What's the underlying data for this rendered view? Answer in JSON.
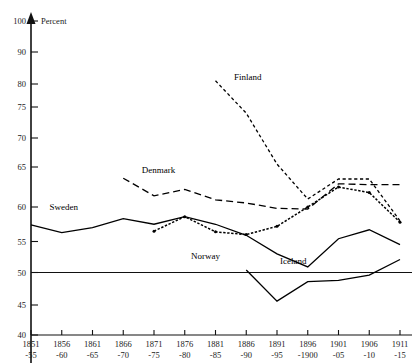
{
  "chart_data": {
    "type": "line",
    "title": "",
    "xlabel": "",
    "ylabel": "Percent",
    "ylim": [
      40,
      100
    ],
    "yticks": [
      40,
      45,
      50,
      55,
      60,
      65,
      70,
      75,
      80,
      90,
      100
    ],
    "grid": false,
    "legend_position": "inline-annotations",
    "reference_line": 50,
    "categories": [
      "1851\n-55",
      "1856\n-60",
      "1861\n-65",
      "1866\n-70",
      "1871\n-75",
      "1876\n-80",
      "1881\n-85",
      "1886\n-90",
      "1891\n-95",
      "1896\n-1900",
      "1901\n-05",
      "1906\n-10",
      "1911\n-15"
    ],
    "categories_top": [
      "1851",
      "1856",
      "1861",
      "1866",
      "1871",
      "1876",
      "1881",
      "1886",
      "1891",
      "1896",
      "1901",
      "1906",
      "1911"
    ],
    "categories_bottom": [
      "-55",
      "-60",
      "-65",
      "-70",
      "-75",
      "-80",
      "-85",
      "-90",
      "-95",
      "-1900",
      "-05",
      "-10",
      "-15"
    ],
    "series": [
      {
        "name": "Sweden",
        "style": "solid",
        "label_x_index": 0.6,
        "label_value": 59.6,
        "values": [
          57.4,
          56.3,
          57.0,
          58.3,
          57.5,
          58.6,
          57.5,
          55.9,
          53.0,
          50.9,
          55.4,
          56.7,
          54.5
        ]
      },
      {
        "name": "Denmark",
        "style": "long-dash",
        "label_x_index": 3.6,
        "label_value": 64.2,
        "values": [
          null,
          null,
          null,
          63.6,
          61.4,
          62.2,
          60.9,
          60.5,
          59.8,
          59.7,
          62.9,
          62.8,
          62.8
        ]
      },
      {
        "name": "Norway",
        "style": "dotted-marker",
        "label_x_index": 5.2,
        "label_value": 52.2,
        "values": [
          null,
          null,
          null,
          null,
          56.5,
          58.6,
          56.4,
          56.0,
          57.2,
          60.0,
          62.5,
          61.8,
          57.8
        ]
      },
      {
        "name": "Finland",
        "style": "short-dash",
        "label_x_index": 6.6,
        "label_value": 81.3,
        "values": [
          null,
          null,
          null,
          null,
          null,
          null,
          81.0,
          74.0,
          65.5,
          61.0,
          63.5,
          63.5,
          58.0
        ]
      },
      {
        "name": "Iceland",
        "style": "solid",
        "label_x_index": 8.1,
        "label_value": 51.4,
        "values": [
          null,
          null,
          null,
          null,
          null,
          null,
          null,
          50.4,
          45.6,
          48.6,
          48.8,
          49.6,
          52.1
        ]
      }
    ],
    "series_secondary_note": "Norway series begins at 1871-75; Denmark at 1866-70; Finland at 1881-85; Iceland at 1886-90"
  },
  "axis": {
    "y_title": "Percent"
  }
}
